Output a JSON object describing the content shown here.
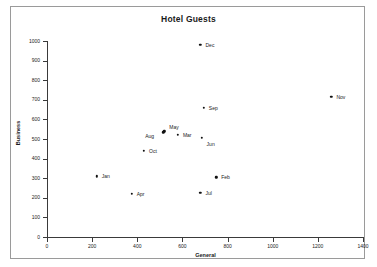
{
  "chart_data": {
    "type": "scatter",
    "title": "Hotel Guests",
    "xlabel": "General",
    "ylabel": "Business",
    "xlim": [
      0,
      1400
    ],
    "ylim": [
      0,
      1000
    ],
    "xticks": [
      0,
      200,
      400,
      600,
      800,
      1000,
      1200,
      1400
    ],
    "yticks": [
      0,
      100,
      200,
      300,
      400,
      500,
      600,
      700,
      800,
      900,
      1000
    ],
    "grid": false,
    "legend": "none",
    "point_color": "#111111",
    "points": [
      {
        "label": "Jan",
        "x": 220,
        "y": 310,
        "label_dx": 5,
        "label_dy": 0
      },
      {
        "label": "Feb",
        "x": 750,
        "y": 305,
        "label_dx": 5,
        "label_dy": 0
      },
      {
        "label": "Mar",
        "x": 580,
        "y": 520,
        "label_dx": 5,
        "label_dy": 0
      },
      {
        "label": "Apr",
        "x": 375,
        "y": 220,
        "label_dx": 5,
        "label_dy": 0
      },
      {
        "label": "May",
        "x": 520,
        "y": 540,
        "label_dx": 5,
        "label_dy": -4
      },
      {
        "label": "Jun",
        "x": 685,
        "y": 505,
        "label_dx": 5,
        "label_dy": 6
      },
      {
        "label": "Jul",
        "x": 680,
        "y": 225,
        "label_dx": 5,
        "label_dy": 0
      },
      {
        "label": "Aug",
        "x": 515,
        "y": 535,
        "label_dx": -18,
        "label_dy": 4
      },
      {
        "label": "Sep",
        "x": 695,
        "y": 660,
        "label_dx": 5,
        "label_dy": 0
      },
      {
        "label": "Oct",
        "x": 430,
        "y": 440,
        "label_dx": 5,
        "label_dy": 0
      },
      {
        "label": "Nov",
        "x": 1260,
        "y": 715,
        "label_dx": 5,
        "label_dy": 0
      },
      {
        "label": "Dec",
        "x": 680,
        "y": 980,
        "label_dx": 5,
        "label_dy": 0
      }
    ]
  }
}
